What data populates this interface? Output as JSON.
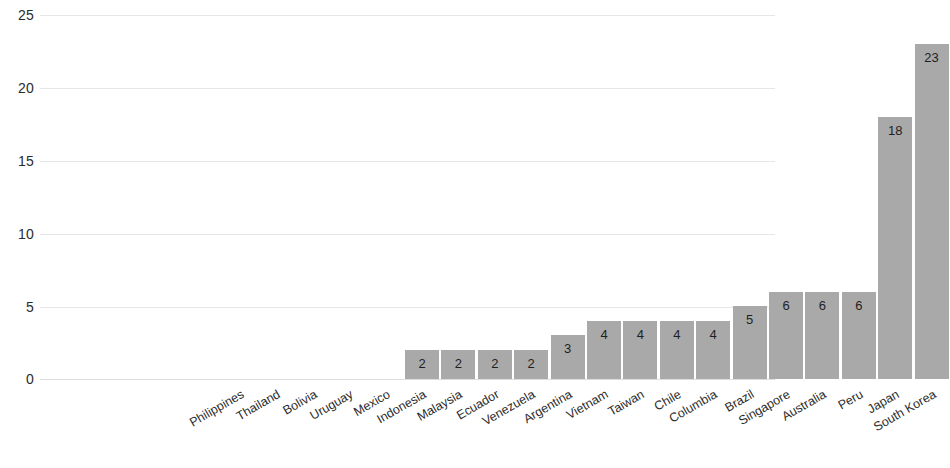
{
  "chart_data": {
    "type": "bar",
    "title": "",
    "subtitle": "",
    "xlabel": "",
    "ylabel": "",
    "ylim": [
      0,
      25
    ],
    "yticks": [
      0,
      5,
      10,
      15,
      20,
      25
    ],
    "grid": true,
    "legend": false,
    "orientation": "vertical",
    "bar_color": "#a9a9a9",
    "label_position": "inside-top",
    "categories": [
      "Philippines",
      "Thailand",
      "Bolivia",
      "Uruguay",
      "Mexico",
      "Indonesia",
      "Malaysia",
      "Ecuador",
      "Venezuela",
      "Argentina",
      "Vietnam",
      "Taiwan",
      "Chile",
      "Columbia",
      "Brazil",
      "Singapore",
      "Australia",
      "Peru",
      "Japan",
      "South Korea"
    ],
    "values": [
      0,
      0,
      0,
      0,
      0,
      2,
      2,
      2,
      2,
      3,
      4,
      4,
      4,
      4,
      5,
      6,
      6,
      6,
      18,
      23
    ],
    "value_labels": [
      "",
      "",
      "",
      "",
      "",
      "2",
      "2",
      "2",
      "2",
      "3",
      "4",
      "4",
      "4",
      "4",
      "5",
      "6",
      "6",
      "6",
      "18",
      "23"
    ]
  },
  "axis": {
    "y_tick_labels": [
      "25",
      "20",
      "15",
      "10",
      "5",
      "0"
    ]
  }
}
